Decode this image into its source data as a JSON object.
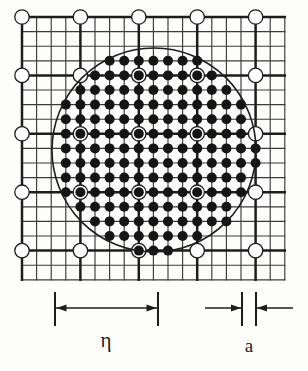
{
  "figure": {
    "name": "mesh-lattice-circle-diagram",
    "background": "#fdfdfc",
    "ink": "#1d1d1d",
    "grid": {
      "origin_x": 22,
      "origin_y": 17,
      "pitch": 14.6,
      "cols": 18,
      "rows": 18,
      "thick_every": 4,
      "thin_width": 1.15,
      "thick_width": 2.5,
      "thin_color": "#3a3a3a",
      "thick_color": "#1d1d1d"
    },
    "open_nodes": {
      "label": "open-lattice-node",
      "radius": 7.2,
      "stroke": "#1d1d1d",
      "stroke_width": 1.3,
      "fill": "#ffffff",
      "at_thick_intersections": true
    },
    "filled_nodes": {
      "label": "filled-lattice-node",
      "radius": 5.0,
      "fill": "#151515"
    },
    "circle": {
      "label": "inclusion-boundary-circle",
      "cx": 154,
      "cy": 150,
      "r": 102,
      "stroke": "#1d1d1d",
      "stroke_width": 1.6,
      "fill": "none"
    }
  },
  "dimensions": {
    "eta": {
      "symbol": "η",
      "name": "eta",
      "y_line": 308,
      "x_start": 55,
      "x_end": 158,
      "tick_top": 292,
      "tick_bottom": 326,
      "arrow_style": "inward-double",
      "label_x": 106,
      "label_y": 347,
      "font_size": 21
    },
    "a": {
      "symbol": "a",
      "name": "lattice-spacing",
      "y_line": 308,
      "x_start": 242,
      "x_end": 256,
      "tick_top": 292,
      "tick_bottom": 326,
      "left_arrow_from": 205,
      "right_arrow_from": 293,
      "arrow_style": "outward-double",
      "label_x": 249,
      "label_y": 352,
      "font_size": 19
    }
  },
  "caption": {
    "eta_text": "η",
    "a_text": "a"
  }
}
